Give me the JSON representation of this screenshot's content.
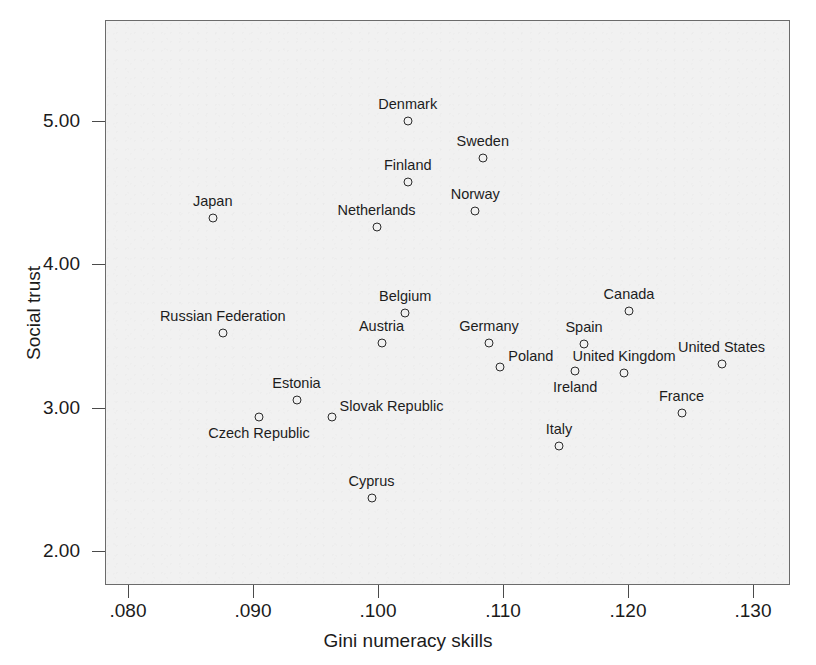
{
  "chart_data": {
    "type": "scatter",
    "title": "",
    "xlabel": "Gini numeracy skills",
    "ylabel": "Social trust",
    "xlim": [
      0.0758,
      0.1306
    ],
    "ylim": [
      1.75,
      5.45
    ],
    "xticks": [
      ".080",
      ".090",
      ".100",
      ".110",
      ".120",
      ".130"
    ],
    "xtick_values": [
      0.08,
      0.09,
      0.1,
      0.11,
      0.12,
      0.13
    ],
    "yticks": [
      "5.00",
      "4.00",
      "3.00",
      "2.00"
    ],
    "ytick_values": [
      5.0,
      4.0,
      3.0,
      2.0
    ],
    "grid": false,
    "legend": "none",
    "marker": "open-circle",
    "points": [
      {
        "label": "Japan",
        "x": 0.0867,
        "y": 4.33,
        "label_pos": "above"
      },
      {
        "label": "Denmark",
        "x": 0.1023,
        "y": 5.01,
        "label_pos": "above"
      },
      {
        "label": "Sweden",
        "x": 0.1083,
        "y": 4.75,
        "label_pos": "above"
      },
      {
        "label": "Finland",
        "x": 0.1023,
        "y": 4.58,
        "label_pos": "above"
      },
      {
        "label": "Norway",
        "x": 0.1077,
        "y": 4.38,
        "label_pos": "above"
      },
      {
        "label": "Netherlands",
        "x": 0.0998,
        "y": 4.27,
        "label_pos": "above"
      },
      {
        "label": "Russian Federation",
        "x": 0.0875,
        "y": 3.53,
        "label_pos": "above"
      },
      {
        "label": "Belgium",
        "x": 0.1021,
        "y": 3.67,
        "label_pos": "above"
      },
      {
        "label": "Canada",
        "x": 0.12,
        "y": 3.68,
        "label_pos": "above"
      },
      {
        "label": "Austria",
        "x": 0.1002,
        "y": 3.46,
        "label_pos": "above"
      },
      {
        "label": "Germany",
        "x": 0.1088,
        "y": 3.46,
        "label_pos": "above"
      },
      {
        "label": "Spain",
        "x": 0.1164,
        "y": 3.45,
        "label_pos": "above"
      },
      {
        "label": "Poland",
        "x": 0.1097,
        "y": 3.29,
        "label_pos": "right"
      },
      {
        "label": "United Kingdom",
        "x": 0.1196,
        "y": 3.25,
        "label_pos": "above"
      },
      {
        "label": "United States",
        "x": 0.1274,
        "y": 3.31,
        "label_pos": "above"
      },
      {
        "label": "Ireland",
        "x": 0.1157,
        "y": 3.26,
        "label_pos": "below"
      },
      {
        "label": "Estonia",
        "x": 0.0934,
        "y": 3.06,
        "label_pos": "above"
      },
      {
        "label": "Slovak Republic",
        "x": 0.0962,
        "y": 2.94,
        "label_pos": "right"
      },
      {
        "label": "Czech Republic",
        "x": 0.0904,
        "y": 2.94,
        "label_pos": "below"
      },
      {
        "label": "France",
        "x": 0.1242,
        "y": 2.97,
        "label_pos": "above"
      },
      {
        "label": "Italy",
        "x": 0.1144,
        "y": 2.74,
        "label_pos": "above"
      },
      {
        "label": "Cyprus",
        "x": 0.0994,
        "y": 2.38,
        "label_pos": "above"
      }
    ]
  },
  "colors": {
    "plot_background": "#f1f1f1",
    "frame": "#6b6b6b",
    "marker": "#2b2b2b",
    "text": "#1b1b1b",
    "page_background": "#ffffff"
  }
}
